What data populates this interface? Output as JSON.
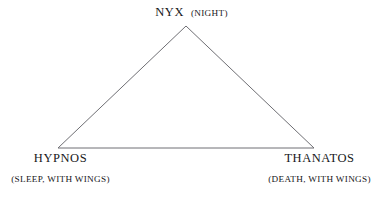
{
  "figure": {
    "type": "triangle-relationship-diagram",
    "background_color": "#ffffff",
    "line_color": "#6f6f74",
    "text_color": "#17171a",
    "line_width_px": 1
  },
  "geometry": {
    "apex": {
      "x": 186,
      "y": 26
    },
    "bottom_left": {
      "x": 58,
      "y": 148
    },
    "bottom_right": {
      "x": 314,
      "y": 148
    }
  },
  "nodes": {
    "apex": {
      "name": "NYX",
      "gloss": "(NIGHT)"
    },
    "bottom_left": {
      "name": "HYPNOS",
      "gloss": "(SLEEP, WITH WINGS)"
    },
    "bottom_right": {
      "name": "THANATOS",
      "gloss": "(DEATH, WITH WINGS)"
    }
  }
}
